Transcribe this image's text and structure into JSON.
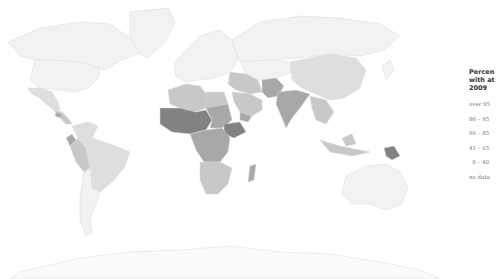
{
  "legend": {
    "title": "Percen\nwith at\n2009",
    "items": [
      {
        "label": "over 95",
        "color": "#f0f0f0"
      },
      {
        "label": "86 – 95",
        "color": "#dcdcdc"
      },
      {
        "label": "66 – 85",
        "color": "#c4c4c4"
      },
      {
        "label": "41 – 65",
        "color": "#a4a4a4"
      },
      {
        "label": "0 – 40",
        "color": "#7e7e7e"
      },
      {
        "label": "no data",
        "color": "#ffffff"
      }
    ]
  },
  "colors": {
    "over95": "#f2f2f2",
    "c86_95": "#dedede",
    "c66_85": "#c8c8c8",
    "c41_65": "#a8a8a8",
    "c0_40": "#828282",
    "nodata": "#fafafa"
  },
  "regions": [
    {
      "name": "greenland",
      "class": "over95"
    },
    {
      "name": "canada",
      "class": "over95"
    },
    {
      "name": "usa",
      "class": "over95"
    },
    {
      "name": "mexico",
      "class": "c86_95"
    },
    {
      "name": "central-america",
      "class": "c66_85"
    },
    {
      "name": "guatemala",
      "class": "c41_65"
    },
    {
      "name": "south-america-north",
      "class": "c86_95"
    },
    {
      "name": "brazil",
      "class": "c86_95"
    },
    {
      "name": "peru-bolivia",
      "class": "c66_85"
    },
    {
      "name": "ecuador",
      "class": "c41_65"
    },
    {
      "name": "argentina-chile",
      "class": "over95"
    },
    {
      "name": "europe",
      "class": "over95"
    },
    {
      "name": "russia",
      "class": "over95"
    },
    {
      "name": "central-asia",
      "class": "over95"
    },
    {
      "name": "china-mongolia",
      "class": "c86_95"
    },
    {
      "name": "middle-east",
      "class": "c66_85"
    },
    {
      "name": "arabia",
      "class": "c66_85"
    },
    {
      "name": "yemen",
      "class": "c41_65"
    },
    {
      "name": "north-africa",
      "class": "c66_85"
    },
    {
      "name": "egypt",
      "class": "c66_85"
    },
    {
      "name": "sahel-west-africa",
      "class": "c0_40"
    },
    {
      "name": "sudan",
      "class": "c41_65"
    },
    {
      "name": "ethiopia",
      "class": "c0_40"
    },
    {
      "name": "central-africa",
      "class": "c41_65"
    },
    {
      "name": "southern-africa",
      "class": "c66_85"
    },
    {
      "name": "madagascar",
      "class": "c41_65"
    },
    {
      "name": "pakistan-afghanistan",
      "class": "c41_65"
    },
    {
      "name": "india",
      "class": "c41_65"
    },
    {
      "name": "southeast-asia",
      "class": "c66_85"
    },
    {
      "name": "indonesia",
      "class": "c66_85"
    },
    {
      "name": "papua-new-guinea",
      "class": "c0_40"
    },
    {
      "name": "australia",
      "class": "over95"
    },
    {
      "name": "japan",
      "class": "over95"
    },
    {
      "name": "antarctica",
      "class": "nodata"
    }
  ]
}
